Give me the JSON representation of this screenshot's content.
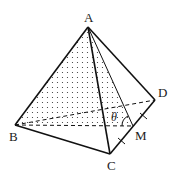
{
  "diagram": {
    "type": "tetrahedron",
    "vertices": {
      "A": {
        "label": "A",
        "x": 88,
        "y": 27
      },
      "B": {
        "label": "B",
        "x": 15,
        "y": 125
      },
      "C": {
        "label": "C",
        "x": 110,
        "y": 154
      },
      "D": {
        "label": "D",
        "x": 155,
        "y": 100
      },
      "M": {
        "label": "M",
        "x": 133,
        "y": 126
      }
    },
    "angle_label": "θ",
    "shaded_face": "ABM",
    "hidden_edges": [
      "BD",
      "BM"
    ],
    "tick_marks": [
      "CM",
      "MD"
    ],
    "colors": {
      "line": "#111111",
      "dots": "#333333",
      "background": "#ffffff"
    }
  }
}
